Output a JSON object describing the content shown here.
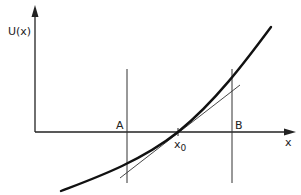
{
  "diagram": {
    "y_axis_label": "U(x)",
    "x_axis_label": "x",
    "point_label_main": "x",
    "point_label_sub": "0",
    "boundary_left_label": "A",
    "boundary_right_label": "B",
    "colors": {
      "ink": "#222222",
      "background": "#ffffff"
    }
  }
}
